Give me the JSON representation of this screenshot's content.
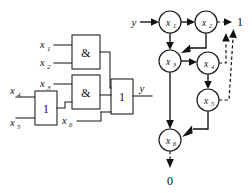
{
  "figure": {
    "background_color": "#ffffff",
    "line_color": "#111111"
  },
  "circuit": {
    "name": "combinational-logic-circuit",
    "inputs": [
      {
        "id": "x1",
        "label": "x",
        "sub": "1"
      },
      {
        "id": "x2",
        "label": "x",
        "sub": "2"
      },
      {
        "id": "x3",
        "label": "x",
        "sub": "3"
      },
      {
        "id": "x4",
        "label": "x",
        "sub": "4"
      },
      {
        "id": "x5",
        "label": "x",
        "sub": "5"
      },
      {
        "id": "x6",
        "label": "x",
        "sub": "6"
      }
    ],
    "gates": [
      {
        "id": "and-gate-top",
        "label": "&",
        "type": "AND",
        "inputs": [
          "x1",
          "x2"
        ]
      },
      {
        "id": "and-gate-middle",
        "label": "&",
        "type": "AND",
        "inputs": [
          "x3",
          "or-gate-left"
        ]
      },
      {
        "id": "or-gate-left",
        "label": "1",
        "type": "OR",
        "inputs": [
          "x4",
          "x5"
        ]
      },
      {
        "id": "or-gate-output",
        "label": "1",
        "type": "OR",
        "inputs": [
          "and-gate-top",
          "and-gate-middle",
          "x6"
        ]
      }
    ],
    "output": {
      "id": "y-out",
      "label": "y"
    }
  },
  "graph": {
    "name": "directed-state-graph",
    "input_label": "y",
    "nodes": [
      {
        "id": "x1",
        "label": "x",
        "sub": "1",
        "cx": 170,
        "cy": 22,
        "r": 11
      },
      {
        "id": "x2",
        "label": "x",
        "sub": "2",
        "cx": 206,
        "cy": 22,
        "r": 11
      },
      {
        "id": "x3",
        "label": "x",
        "sub": "3",
        "cx": 170,
        "cy": 61,
        "r": 11
      },
      {
        "id": "x4",
        "label": "x",
        "sub": "4",
        "cx": 208,
        "cy": 63,
        "r": 11
      },
      {
        "id": "x5",
        "label": "x",
        "sub": "5",
        "cx": 208,
        "cy": 100,
        "r": 11
      },
      {
        "id": "x6",
        "label": "x",
        "sub": "6",
        "cx": 170,
        "cy": 140,
        "r": 11
      }
    ],
    "terminals": [
      {
        "id": "terminal-one",
        "label": "1",
        "x": 240,
        "y": 26
      },
      {
        "id": "terminal-zero",
        "label": "0",
        "x": 170,
        "y": 185
      }
    ],
    "edges": [
      {
        "from": "input",
        "to": "x1",
        "style": "solid"
      },
      {
        "from": "x1",
        "to": "x2",
        "style": "solid"
      },
      {
        "from": "x1",
        "to": "x3",
        "style": "solid"
      },
      {
        "from": "x2",
        "to": "terminal-one",
        "style": "dashed"
      },
      {
        "from": "x2",
        "to": "x3",
        "style": "solid"
      },
      {
        "from": "x3",
        "to": "x4",
        "style": "solid"
      },
      {
        "from": "x3",
        "to": "x6",
        "style": "solid"
      },
      {
        "from": "x4",
        "to": "terminal-one",
        "style": "dashed"
      },
      {
        "from": "x4",
        "to": "x5",
        "style": "solid"
      },
      {
        "from": "x5",
        "to": "terminal-one",
        "style": "dashed"
      },
      {
        "from": "x5",
        "to": "x6",
        "style": "solid"
      },
      {
        "from": "x6",
        "to": "terminal-zero",
        "style": "dashed"
      }
    ]
  }
}
